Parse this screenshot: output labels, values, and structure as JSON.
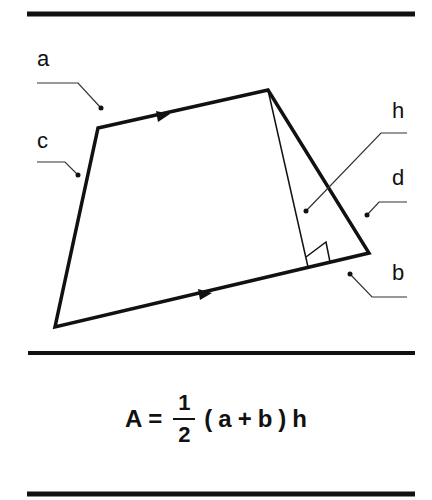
{
  "diagram": {
    "labels": {
      "a": "a",
      "b": "b",
      "c": "c",
      "d": "d",
      "h": "h"
    },
    "colors": {
      "stroke": "#111111",
      "background": "#ffffff"
    }
  },
  "formula": {
    "lhs": "A",
    "equals": "=",
    "numerator": "1",
    "denominator": "2",
    "open_paren": "(",
    "a": "a",
    "plus": "+",
    "b": "b",
    "close_paren": ")",
    "h": "h"
  }
}
